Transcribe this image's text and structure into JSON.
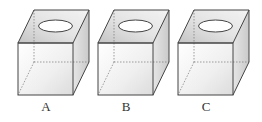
{
  "figure": {
    "type": "three identical cubes with an oval hole on top",
    "cubes": [
      {
        "label": "A",
        "offset_x": 0
      },
      {
        "label": "B",
        "offset_x": 80
      },
      {
        "label": "C",
        "offset_x": 160
      }
    ],
    "colors": {
      "edge": "#444444",
      "hidden_edge": "#777777",
      "top_face_dark": "#cfcfcf",
      "front_face_light": "#f4f4f4",
      "side_face": "#e2e2e2",
      "hole": "#ffffff"
    }
  }
}
